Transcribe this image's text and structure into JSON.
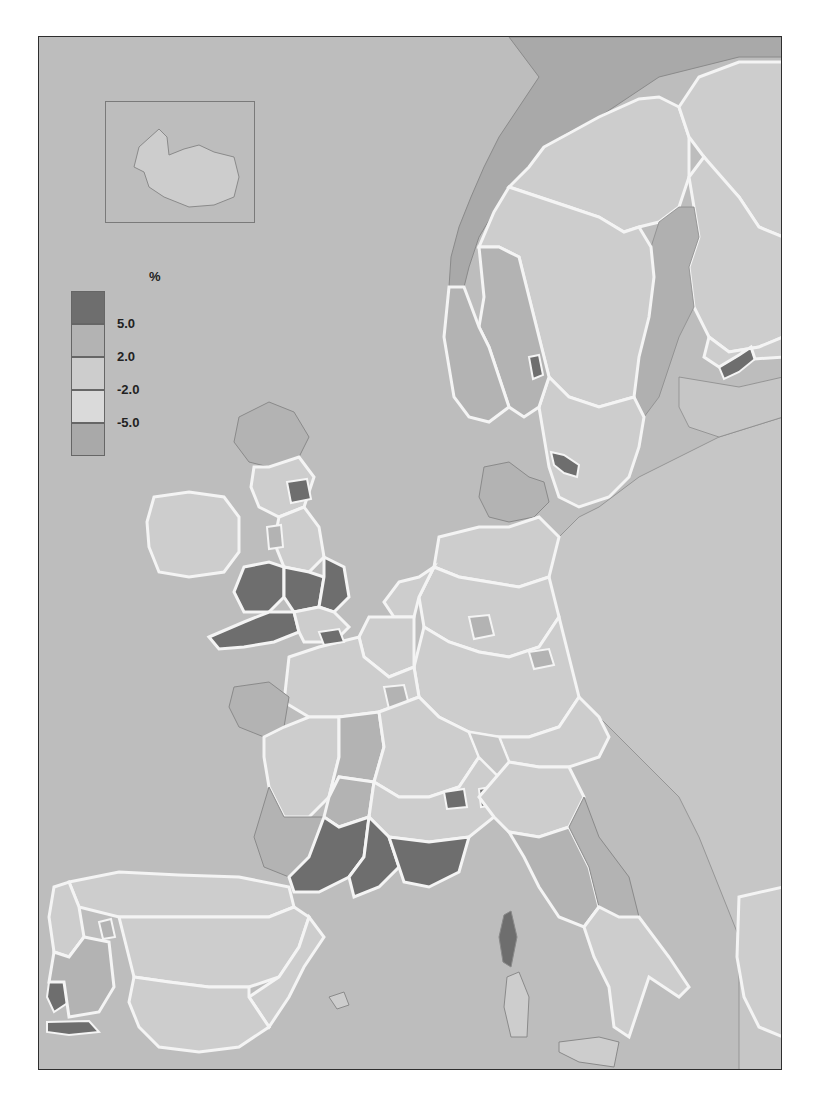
{
  "map": {
    "unit_label": "%",
    "legend": [
      {
        "class": "gt5",
        "color": "#6e6e6e",
        "label": "5.0"
      },
      {
        "class": "2to5",
        "color": "#b3b3b3",
        "label": "2.0"
      },
      {
        "class": "m2to2",
        "color": "#cdcdcd",
        "label": "-2.0"
      },
      {
        "class": "m5tom2",
        "color": "#dadada",
        "label": "-5.0"
      },
      {
        "class": "ltm5",
        "color": "#a9a9a9",
        "label": ""
      }
    ],
    "colors": {
      "sea": "#bdbdbd",
      "non_eu_land": "#c6c6c6",
      "border": "#f4f4f4",
      "frame": "#2e2e2e"
    },
    "inset": {
      "name": "Iceland",
      "class": "m2to2"
    },
    "highlighted_regions_gt5": [
      "Wales",
      "South West England",
      "Midlands (England)",
      "East Anglia",
      "North East England (parts)",
      "Languedoc-Roussillon",
      "Midi-Pyrenees (south)",
      "Provence-Alpes-Cote d'Azur",
      "Corse",
      "Rhone-Alpes (parts)",
      "Lisboa",
      "Algarve",
      "Hedmark (Norway)",
      "Skane (Sweden)",
      "Uusimaa (Finland)"
    ]
  }
}
